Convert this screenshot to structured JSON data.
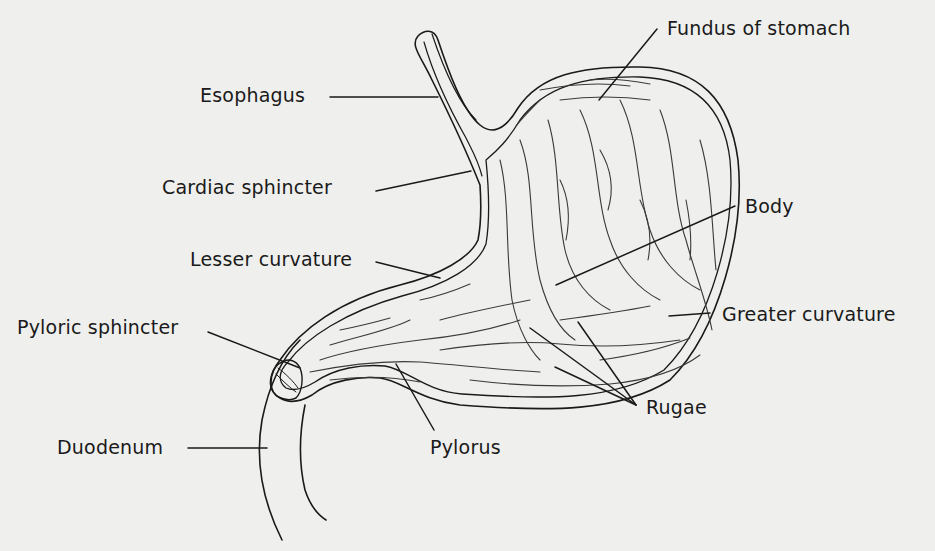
{
  "diagram": {
    "colors": {
      "background": "#efefed",
      "ink": "#1a1a1a",
      "rugae": "#3a3a3a"
    },
    "labels": {
      "fundus": "Fundus of stomach",
      "esophagus": "Esophagus",
      "cardiac_sphincter": "Cardiac sphincter",
      "body": "Body",
      "lesser_curvature": "Lesser curvature",
      "greater_curvature": "Greater curvature",
      "pyloric_sphincter": "Pyloric sphincter",
      "rugae": "Rugae",
      "duodenum": "Duodenum",
      "pylorus": "Pylorus"
    }
  }
}
